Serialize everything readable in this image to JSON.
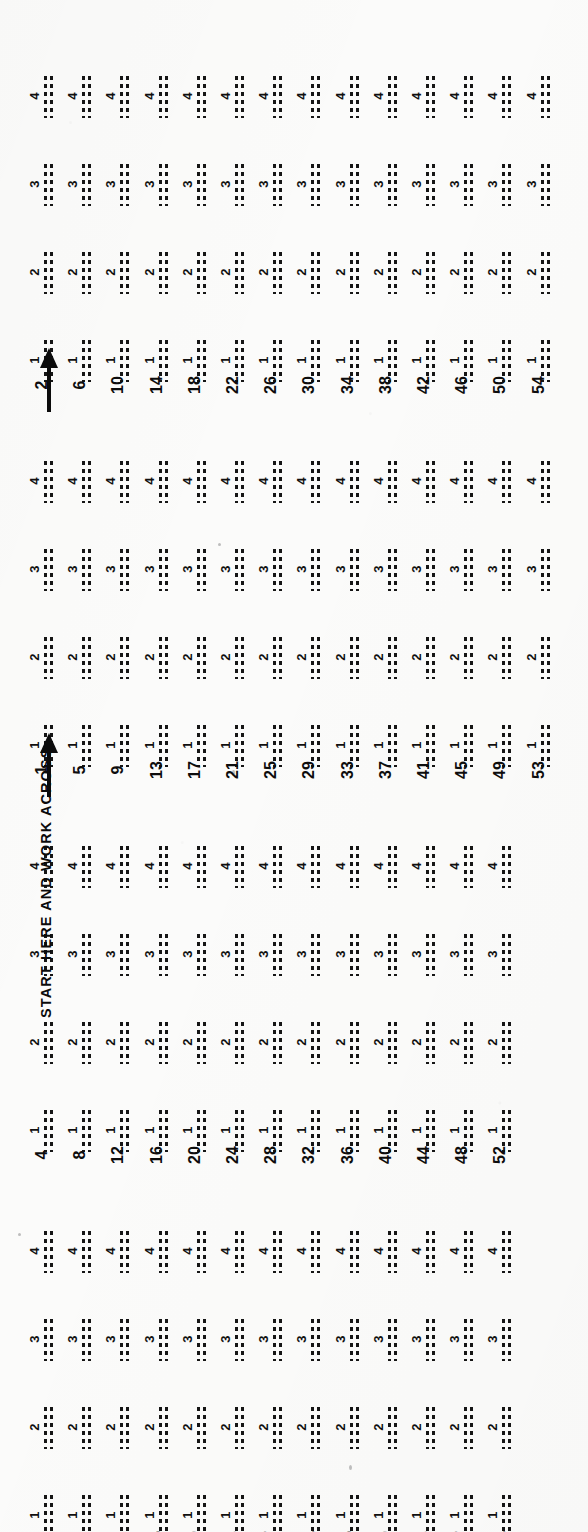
{
  "document": {
    "kind": "answer-sheet",
    "instruction": "START HERE AND WORK ACROSS",
    "orientation_note": "sheet scanned rotated 90 degrees",
    "ink_color": "#101010",
    "paper_color": "#fbfbfa"
  },
  "options": {
    "labels": [
      "1",
      "2",
      "3",
      "4"
    ],
    "marks_per_option": 2,
    "mark_style": "dashed-rule"
  },
  "blocks": [
    {
      "id": "block-1",
      "name": "column-group-2",
      "has_arrow": true,
      "has_caption": false,
      "numbers": [
        "2",
        "6",
        "10",
        "14",
        "18",
        "22",
        "26",
        "30",
        "34",
        "38",
        "42",
        "46",
        "50",
        "54"
      ]
    },
    {
      "id": "block-2",
      "name": "column-group-1",
      "has_arrow": true,
      "has_caption": true,
      "numbers": [
        "1",
        "5",
        "9",
        "13",
        "17",
        "21",
        "25",
        "29",
        "33",
        "37",
        "41",
        "45",
        "49",
        "53"
      ]
    },
    {
      "id": "block-3",
      "name": "column-group-4",
      "has_arrow": false,
      "has_caption": false,
      "numbers": [
        "4",
        "8",
        "12",
        "16",
        "20",
        "24",
        "28",
        "32",
        "36",
        "40",
        "44",
        "48",
        "52"
      ]
    },
    {
      "id": "block-4",
      "name": "column-group-3",
      "has_arrow": false,
      "has_caption": false,
      "numbers": [
        "3",
        "7",
        "11",
        "15",
        "19",
        "23",
        "27",
        "31",
        "35",
        "39",
        "43",
        "47",
        "51"
      ]
    }
  ],
  "chart_data": {
    "type": "table",
    "columns": [
      "question",
      "option-1",
      "option-2",
      "option-3",
      "option-4"
    ],
    "question_numbers": [
      1,
      2,
      3,
      4,
      5,
      6,
      7,
      8,
      9,
      10,
      11,
      12,
      13,
      14,
      15,
      16,
      17,
      18,
      19,
      20,
      21,
      22,
      23,
      24,
      25,
      26,
      27,
      28,
      29,
      30,
      31,
      32,
      33,
      34,
      35,
      36,
      37,
      38,
      39,
      40,
      41,
      42,
      43,
      44,
      45,
      46,
      47,
      48,
      49,
      50,
      51,
      52,
      53,
      54
    ],
    "marked_answers": [],
    "note": "All answer blanks are empty (unmarked dashed rules)."
  }
}
